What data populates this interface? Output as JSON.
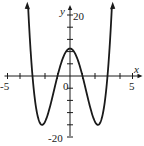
{
  "chart_data": {
    "type": "line",
    "title": "",
    "xlabel": "x",
    "ylabel": "y",
    "xlim": [
      -5,
      5
    ],
    "ylim": [
      -20,
      20
    ],
    "x_tick_step": 1,
    "y_tick_step": 4,
    "x_tick_labels": [
      "-5",
      "0",
      "5"
    ],
    "y_tick_labels": [
      "20",
      "-20"
    ],
    "grid": false,
    "legend": null,
    "function": "f(x) = x^4 - 10x^2 + 9",
    "series": [
      {
        "name": "f(x)",
        "x": [
          -3.35,
          -3,
          -2.5,
          -2.24,
          -2,
          -1.5,
          -1,
          -0.5,
          0,
          0.5,
          1,
          1.5,
          2,
          2.24,
          2.5,
          3,
          3.35
        ],
        "values": [
          22.7,
          0,
          -13.6,
          -16,
          -15,
          -8.4,
          0,
          6.6,
          9,
          6.6,
          0,
          -8.4,
          -15,
          -16,
          -13.6,
          0,
          22.7
        ]
      }
    ],
    "key_points": {
      "x_intercepts": [
        -3,
        -1,
        1,
        3
      ],
      "y_intercept": 9,
      "local_max": [
        0,
        9
      ],
      "local_mins": [
        [
          -2.24,
          -16
        ],
        [
          2.24,
          -16
        ]
      ]
    },
    "colors": {
      "curve": "#1a1a1a",
      "axes": "#1a1a1a",
      "background": "#ffffff"
    }
  },
  "labels": {
    "x_axis": "x",
    "y_axis": "y",
    "x_min": "-5",
    "x_origin": "0",
    "x_max": "5",
    "y_max": "20",
    "y_min": "-20"
  }
}
